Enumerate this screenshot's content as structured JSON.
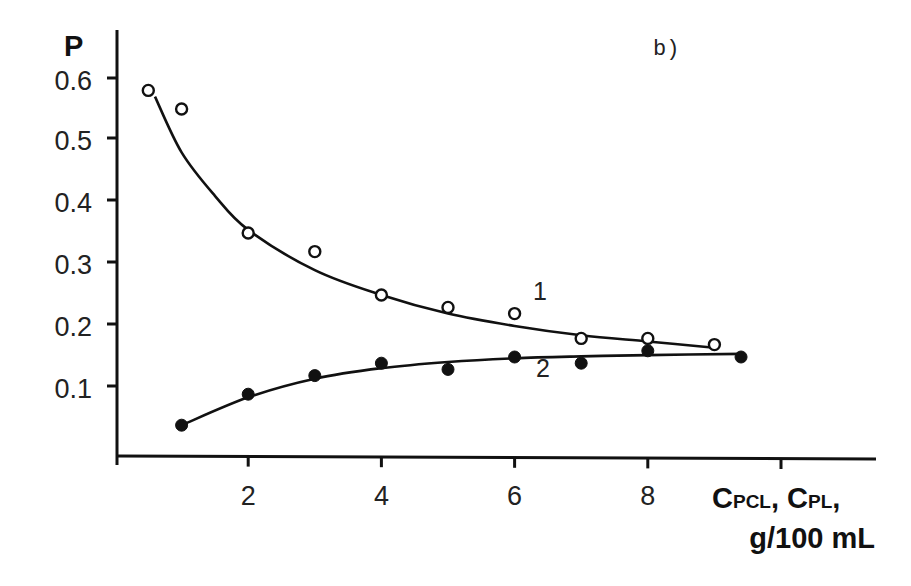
{
  "chart_data": {
    "type": "scatter",
    "title": "",
    "panel_label": "b)",
    "ylabel": "P",
    "xlabel": "C_PCL, C_PL, g/100 mL",
    "xlabel_parts": {
      "c1": "C",
      "s1": "PCL",
      "sep": ", ",
      "c2": "C",
      "s2": "PL",
      "end": ",",
      "units": "g/100 mL"
    },
    "xlim": [
      0,
      11.5
    ],
    "ylim": [
      0,
      0.68
    ],
    "x_ticks": [
      2,
      4,
      6,
      8,
      10
    ],
    "x_tick_labels": [
      "2",
      "4",
      "6",
      "8",
      ""
    ],
    "y_ticks": [
      0.1,
      0.2,
      0.3,
      0.4,
      0.5,
      0.6
    ],
    "y_tick_labels": [
      "0.1",
      "0.2",
      "0.3",
      "0.4",
      "0.5",
      "0.6"
    ],
    "grid": false,
    "legend": "inline curve labels",
    "series": [
      {
        "name": "1",
        "marker": "open-circle",
        "fit": "decreasing curve",
        "x": [
          0.5,
          1.0,
          2.0,
          3.0,
          4.0,
          5.0,
          6.0,
          7.0,
          8.0,
          9.0
        ],
        "values": [
          0.58,
          0.55,
          0.35,
          0.32,
          0.25,
          0.23,
          0.22,
          0.18,
          0.18,
          0.17
        ],
        "fit_x": [
          0.6,
          1.0,
          1.5,
          2.0,
          3.0,
          4.0,
          5.0,
          6.0,
          7.0,
          8.0,
          9.0
        ],
        "fit_y": [
          0.57,
          0.48,
          0.41,
          0.355,
          0.29,
          0.25,
          0.22,
          0.2,
          0.185,
          0.175,
          0.165
        ]
      },
      {
        "name": "2",
        "marker": "filled-circle",
        "fit": "increasing saturating curve",
        "x": [
          1.0,
          2.0,
          3.0,
          4.0,
          5.0,
          6.0,
          7.0,
          8.0,
          9.4
        ],
        "values": [
          0.04,
          0.09,
          0.12,
          0.14,
          0.13,
          0.15,
          0.14,
          0.16,
          0.15
        ],
        "fit_x": [
          1.0,
          2.0,
          3.0,
          4.0,
          5.0,
          6.0,
          7.0,
          8.0,
          9.4
        ],
        "fit_y": [
          0.04,
          0.085,
          0.115,
          0.132,
          0.142,
          0.148,
          0.151,
          0.153,
          0.155
        ]
      }
    ]
  }
}
